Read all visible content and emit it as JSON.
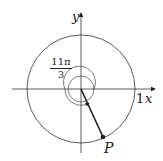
{
  "diagram": {
    "title": "",
    "axes": {
      "x_label": "x",
      "y_label": "y",
      "unit_tick_label": "1"
    },
    "angle": {
      "numerator": "11π",
      "denominator": "3"
    },
    "point": {
      "label": "P"
    },
    "colors": {
      "stroke": "#222222",
      "background": "#ffffff"
    }
  }
}
